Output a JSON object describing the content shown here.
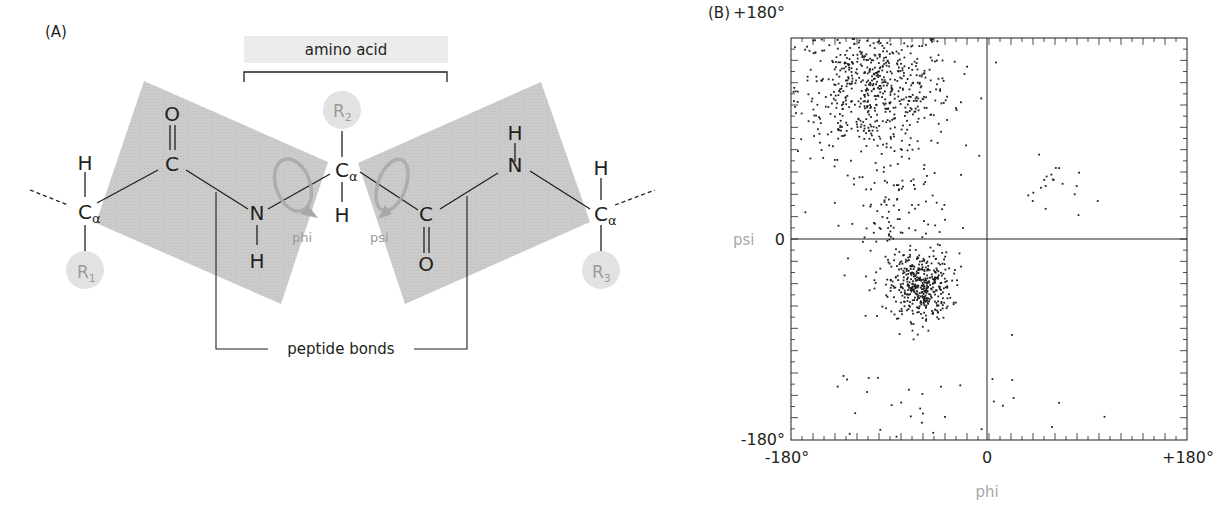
{
  "panel_a": {
    "label": "(A)",
    "amino_acid_label": "amino acid",
    "peptide_bonds_label": "peptide bonds",
    "atoms": {
      "h_left": "H",
      "c_alpha_1": "C",
      "alpha_1": "α",
      "r1": "R",
      "r1_sub": "1",
      "o_1": "O",
      "c_1": "C",
      "n_1": "N",
      "h_n1": "H",
      "r2": "R",
      "r2_sub": "2",
      "c_alpha_2": "C",
      "alpha_2": "α",
      "h_ca2": "H",
      "c_2": "C",
      "o_2": "O",
      "h_n2": "H",
      "n_2": "N",
      "h_right": "H",
      "c_alpha_3": "C",
      "alpha_3": "α",
      "r3": "R",
      "r3_sub": "3"
    },
    "rotations": {
      "phi": "phi",
      "psi": "psi"
    },
    "colors": {
      "plane": "#c8c8c8",
      "r_group": "#e2e2e2",
      "rotation_arrow": "#a8a8a8",
      "text_grey": "#9b9b9b"
    }
  },
  "panel_b": {
    "label": "(B)"
  },
  "chart_data": {
    "type": "scatter",
    "title": "",
    "xlabel": "phi",
    "ylabel": "psi",
    "xlim": [
      -180,
      180
    ],
    "ylim": [
      -180,
      180
    ],
    "x_tick_labels": [
      "-180°",
      "0",
      "+180°"
    ],
    "y_tick_labels": [
      "+180°",
      "0",
      "-180°"
    ],
    "grid": false,
    "zero_lines": true,
    "legend": null,
    "point_color": "#231f20",
    "point_data_note": "Individual point coordinates were not extracted from the figure. The clusters below are approximate region descriptors estimated visually; rendered dots are procedurally generated to mimic the density pattern, not the original data.",
    "clusters": [
      {
        "name": "beta-sheet region",
        "center_phi": -105,
        "center_psi": 135,
        "spread_phi": 35,
        "spread_psi": 30,
        "approx_points": 650
      },
      {
        "name": "alpha-helix region",
        "center_phi": -63,
        "center_psi": -42,
        "spread_phi": 14,
        "spread_psi": 15,
        "approx_points": 420
      },
      {
        "name": "bridge region",
        "center_phi": -85,
        "center_psi": 20,
        "spread_phi": 22,
        "spread_psi": 30,
        "approx_points": 120
      },
      {
        "name": "left-handed helix region",
        "center_phi": 60,
        "center_psi": 45,
        "spread_phi": 14,
        "spread_psi": 14,
        "approx_points": 20
      },
      {
        "name": "sparse outliers",
        "center_phi": -60,
        "center_psi": -150,
        "spread_phi": 70,
        "spread_psi": 25,
        "approx_points": 35
      }
    ]
  }
}
